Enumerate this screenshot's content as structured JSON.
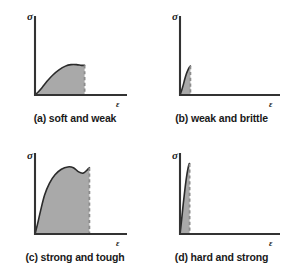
{
  "figure": {
    "background_color": "#ffffff",
    "axis_color": "#333333",
    "curve_color": "#2b2b2b",
    "fill_color": "#a9a9a9",
    "dash_color": "#8c8c8c",
    "y_axis_label": "σ",
    "x_axis_label": "ε"
  },
  "chart_data": {
    "type": "line",
    "xlabel": "ε",
    "ylabel": "σ",
    "xlim": [
      0,
      100
    ],
    "ylim": [
      0,
      100
    ],
    "grid": false,
    "legend": "none",
    "panels": [
      {
        "key": "a",
        "caption": "(a) soft and weak",
        "y_axis_label": "σ",
        "x_axis_label": "ε",
        "fracture_strain": 62,
        "peak_stress": 40,
        "description": "low modulus, low strength, moderate ductility",
        "points": [
          [
            0,
            0
          ],
          [
            4,
            4
          ],
          [
            9,
            10
          ],
          [
            15,
            18
          ],
          [
            22,
            26
          ],
          [
            30,
            33
          ],
          [
            38,
            38
          ],
          [
            45,
            40
          ],
          [
            52,
            40
          ],
          [
            58,
            39
          ],
          [
            62,
            39
          ]
        ]
      },
      {
        "key": "b",
        "caption": "(b) weak and brittle",
        "y_axis_label": "σ",
        "x_axis_label": "ε",
        "fracture_strain": 13,
        "peak_stress": 38,
        "description": "low strength, very low ductility",
        "points": [
          [
            0,
            0
          ],
          [
            2,
            6
          ],
          [
            4,
            13
          ],
          [
            6,
            21
          ],
          [
            8,
            28
          ],
          [
            10,
            33
          ],
          [
            12,
            37
          ],
          [
            13,
            38
          ]
        ]
      },
      {
        "key": "c",
        "caption": "(c) strong and tough",
        "y_axis_label": "σ",
        "x_axis_label": "ε",
        "fracture_strain": 68,
        "peak_stress": 86,
        "description": "high modulus, high strength, high ductility, largest area",
        "points": [
          [
            0,
            0
          ],
          [
            3,
            12
          ],
          [
            7,
            30
          ],
          [
            12,
            50
          ],
          [
            18,
            65
          ],
          [
            25,
            76
          ],
          [
            33,
            83
          ],
          [
            41,
            86
          ],
          [
            48,
            85
          ],
          [
            54,
            80
          ],
          [
            60,
            78
          ],
          [
            65,
            82
          ],
          [
            68,
            85
          ]
        ]
      },
      {
        "key": "d",
        "caption": "(d) hard and strong",
        "y_axis_label": "σ",
        "x_axis_label": "ε",
        "fracture_strain": 12,
        "peak_stress": 90,
        "description": "very high modulus, very high strength, very low ductility",
        "points": [
          [
            0,
            0
          ],
          [
            2,
            18
          ],
          [
            4,
            38
          ],
          [
            6,
            56
          ],
          [
            8,
            72
          ],
          [
            10,
            84
          ],
          [
            11.5,
            90
          ],
          [
            12,
            90
          ]
        ]
      }
    ]
  }
}
